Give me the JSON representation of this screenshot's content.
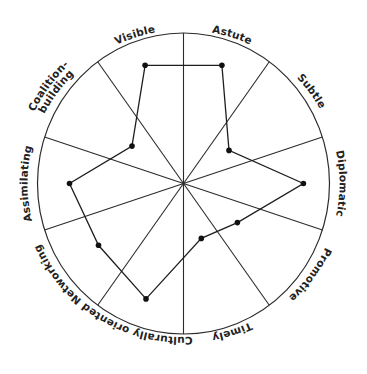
{
  "chart_data": {
    "type": "radar",
    "title": "",
    "categories": [
      "Astute",
      "Subtle",
      "Diplomatic",
      "Promotive",
      "Timely",
      "Culturally oriented",
      "Networking",
      "Assimilating",
      "Coalition-building",
      "Visible"
    ],
    "category_angles_deg": [
      18,
      54,
      90,
      126,
      162,
      198,
      234,
      270,
      306,
      342
    ],
    "series": [
      {
        "name": "Profile",
        "values": [
          0.84,
          0.38,
          0.81,
          0.45,
          0.39,
          0.82,
          0.71,
          0.77,
          0.43,
          0.84
        ]
      }
    ],
    "range": [
      0,
      1
    ],
    "grid": "spokes only (10 sectors, 5 lines through center), single outer circle",
    "legend": "none",
    "label_placement": "curved text along outer circle, reading clockwise"
  },
  "labels": {
    "astute": "Astute",
    "subtle": "Subtle",
    "diplomatic": "Diplomatic",
    "promotive": "Promotive",
    "timely": "Timely",
    "culturally_oriented": "Culturally oriented",
    "networking": "Networking",
    "assimilating": "Assimilating",
    "coalition_line1": "Coalition-",
    "coalition_line2": "building",
    "visible": "Visible"
  },
  "colors": {
    "line": "#1e1e1e",
    "rim": "#2b2b2b",
    "text": "#222222",
    "background": "#ffffff"
  }
}
